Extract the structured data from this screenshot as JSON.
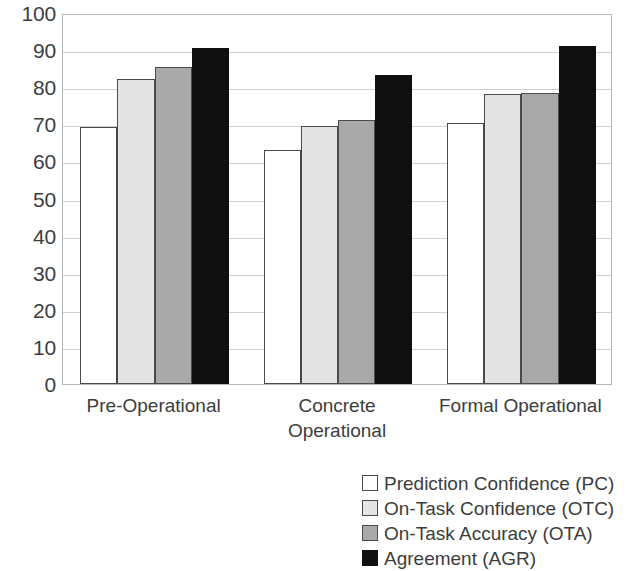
{
  "chart_data": {
    "type": "bar",
    "title": "",
    "xlabel": "",
    "ylabel": "",
    "ylim": [
      0,
      100
    ],
    "yticks": [
      0,
      10,
      20,
      30,
      40,
      50,
      60,
      70,
      80,
      90,
      100
    ],
    "ytick_labels": [
      "0",
      "10",
      "20",
      "30",
      "40",
      "50",
      "60",
      "70",
      "80",
      "90",
      "100"
    ],
    "grid": true,
    "legend_position": "bottom-right",
    "categories": [
      "Pre-Operational",
      "Concrete Operational",
      "Formal Operational"
    ],
    "category_lines": [
      [
        "Pre-Operational"
      ],
      [
        "Concrete",
        "Operational"
      ],
      [
        "Formal Operational"
      ]
    ],
    "series": [
      {
        "name": "Prediction Confidence (PC)",
        "short": "PC",
        "color": "#ffffff",
        "values": [
          69.2,
          63.0,
          70.4
        ]
      },
      {
        "name": "On-Task Confidence (OTC)",
        "short": "OTC",
        "color": "#e4e4e4",
        "values": [
          82.1,
          69.5,
          78.2
        ]
      },
      {
        "name": "On-Task Accuracy (OTA)",
        "short": "OTA",
        "color": "#a9a9a9",
        "values": [
          85.5,
          71.2,
          78.4
        ]
      },
      {
        "name": "Agreement (AGR)",
        "short": "AGR",
        "color": "#101010",
        "values": [
          90.7,
          83.2,
          91.0
        ]
      }
    ]
  },
  "legend": {
    "items": [
      {
        "label": "Prediction Confidence (PC)",
        "swatch": "#ffffff"
      },
      {
        "label": "On-Task Confidence (OTC)",
        "swatch": "#e4e4e4"
      },
      {
        "label": "On-Task Accuracy (OTA)",
        "swatch": "#a9a9a9"
      },
      {
        "label": "Agreement (AGR)",
        "swatch": "#101010"
      }
    ]
  }
}
